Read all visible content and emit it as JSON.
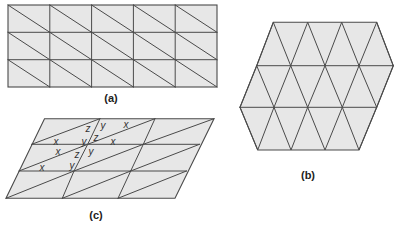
{
  "figures": {
    "a": {
      "caption": "(a)",
      "description": "Rectangular grid, 5 columns x 3 rows, each cell split by a diagonal from top-left to bottom-right",
      "columns": 5,
      "rows": 3
    },
    "b": {
      "caption": "(b)",
      "description": "Hexagonal patch tiled by equilateral triangles",
      "rows": 3
    },
    "c": {
      "caption": "(c)",
      "description": "Parallelogram grid, 3 columns x 3 rows, each cell split by a diagonal from bottom-left to top-right, with angle labels",
      "columns": 3,
      "rows": 3,
      "angle_labels": [
        {
          "text": "z",
          "x": 88,
          "y": 128
        },
        {
          "text": "y",
          "x": 103,
          "y": 125
        },
        {
          "text": "x",
          "x": 126,
          "y": 124
        },
        {
          "text": "y",
          "x": 84,
          "y": 141
        },
        {
          "text": "z",
          "x": 96,
          "y": 137
        },
        {
          "text": "x",
          "x": 113,
          "y": 141
        },
        {
          "text": "x",
          "x": 56,
          "y": 141
        },
        {
          "text": "x",
          "x": 58,
          "y": 151
        },
        {
          "text": "z",
          "x": 77,
          "y": 154
        },
        {
          "text": "y",
          "x": 91,
          "y": 151
        },
        {
          "text": "x",
          "x": 42,
          "y": 167
        },
        {
          "text": "y",
          "x": 72,
          "y": 165
        }
      ]
    }
  },
  "colors": {
    "fill": "#e7e7e7",
    "stroke": "#4a4a4a",
    "text": "#222222"
  }
}
